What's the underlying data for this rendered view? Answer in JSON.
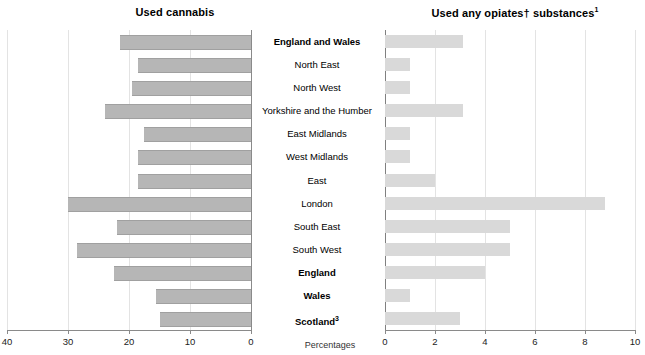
{
  "chart_data": {
    "type": "bar",
    "title": "",
    "orientation": "horizontal",
    "layout": "back-to-back paired horizontal bar chart (butterfly / tornado)",
    "grid": true,
    "legend_position": "none",
    "axis_unit_label": "Percentages",
    "categories": [
      "England and Wales",
      "North East",
      "North West",
      "Yorkshire and the Humber",
      "East Midlands",
      "West Midlands",
      "East",
      "London",
      "South East",
      "South West",
      "England",
      "Wales",
      "Scotland"
    ],
    "category_emphasis": [
      true,
      false,
      false,
      false,
      false,
      false,
      false,
      false,
      false,
      false,
      true,
      true,
      true
    ],
    "category_superscripts": [
      "",
      "",
      "",
      "",
      "",
      "",
      "",
      "",
      "",
      "",
      "",
      "",
      "3"
    ],
    "panels": [
      {
        "name": "left",
        "title": "Used cannabis",
        "title_superscript": "",
        "xlabel": "Percentages",
        "ylabel": "",
        "xlim": [
          40,
          0
        ],
        "direction": "right-to-left",
        "tick_labels": [
          "40",
          "30",
          "20",
          "10",
          "0"
        ],
        "ticks": [
          40,
          30,
          20,
          10,
          0
        ],
        "bar_color": "#b6b6b6",
        "values": [
          21.5,
          18.5,
          19.5,
          24.0,
          17.5,
          18.5,
          18.5,
          30.0,
          22.0,
          28.5,
          22.5,
          15.5,
          15.0
        ]
      },
      {
        "name": "right",
        "title": "Used any opiates† substances",
        "title_superscript": "1",
        "xlabel": "Percentages",
        "ylabel": "",
        "xlim": [
          0,
          10
        ],
        "direction": "left-to-right",
        "tick_labels": [
          "0",
          "2",
          "4",
          "6",
          "8",
          "10"
        ],
        "ticks": [
          0,
          2,
          4,
          6,
          8,
          10
        ],
        "bar_color": "#d9d9d9",
        "values": [
          3.1,
          1.0,
          1.0,
          3.1,
          1.0,
          1.0,
          2.0,
          8.8,
          5.0,
          5.0,
          4.0,
          1.0,
          3.0
        ]
      }
    ]
  },
  "footnote_markers": {
    "dagger": "†",
    "scotland_note": "3",
    "opiates_note": "1"
  }
}
